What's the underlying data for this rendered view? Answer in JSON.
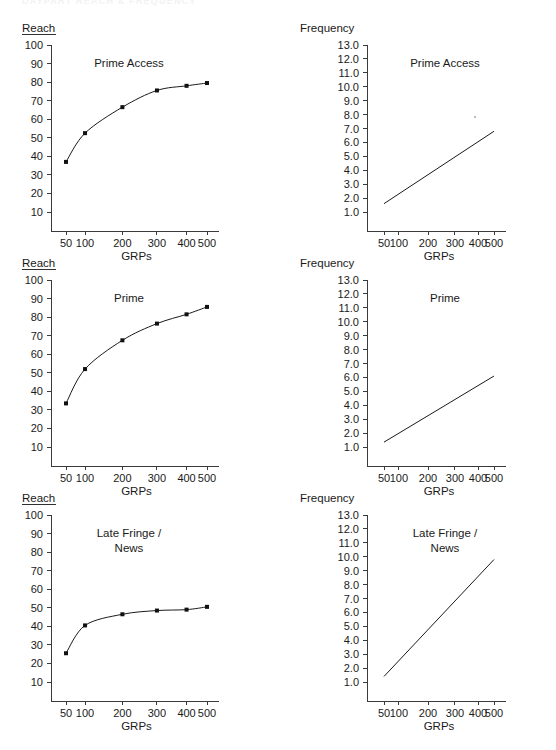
{
  "page": {
    "cut_off_header": "DAYPART REACH & FREQUENCY",
    "background_color": "#ffffff",
    "ink_color": "#1a1a1a"
  },
  "labels": {
    "reach_axis": "Reach",
    "frequency_axis": "Frequency",
    "grps_axis": "GRPs"
  },
  "x_ticks": [
    "50",
    "100",
    "200",
    "300",
    "400",
    "500"
  ],
  "reach_y_ticks": [
    "100",
    "90",
    "80",
    "70",
    "60",
    "50",
    "40",
    "30",
    "20",
    "10"
  ],
  "frequency_y_ticks": [
    "13.0",
    "12.0",
    "11.0",
    "10.0",
    "9.0",
    "8.0",
    "7.0",
    "6.0",
    "5.0",
    "4.0",
    "3.0",
    "2.0",
    "1.0"
  ],
  "series_names": {
    "prime_access": "Prime Access",
    "prime": "Prime",
    "late_fringe_line1": "Late Fringe /",
    "late_fringe_line2": "News"
  },
  "chart_data": [
    {
      "id": "reach-prime-access",
      "type": "line",
      "title": "Prime Access",
      "xlabel": "GRPs",
      "ylabel": "Reach",
      "x": [
        50,
        100,
        200,
        300,
        400,
        500
      ],
      "values": [
        37,
        52.5,
        66.5,
        75.5,
        78,
        79.5
      ],
      "xticks": [
        50,
        100,
        200,
        300,
        400,
        500
      ],
      "yticks": [
        10,
        20,
        30,
        40,
        50,
        60,
        70,
        80,
        90,
        100
      ],
      "ylim": [
        0,
        100
      ],
      "grid": false,
      "markers": "square",
      "legend": "none"
    },
    {
      "id": "frequency-prime-access",
      "type": "line",
      "title": "Prime Access",
      "xlabel": "GRPs",
      "ylabel": "Frequency",
      "x": [
        50,
        500
      ],
      "values": [
        1.6,
        6.8
      ],
      "xticks": [
        50,
        100,
        200,
        300,
        400,
        500
      ],
      "yticks": [
        1.0,
        2.0,
        3.0,
        4.0,
        5.0,
        6.0,
        7.0,
        8.0,
        9.0,
        10.0,
        11.0,
        12.0,
        13.0
      ],
      "ylim": [
        0,
        13.0
      ],
      "grid": false,
      "markers": "none",
      "legend": "none"
    },
    {
      "id": "reach-prime",
      "type": "line",
      "title": "Prime",
      "xlabel": "GRPs",
      "ylabel": "Reach",
      "x": [
        50,
        100,
        200,
        300,
        400,
        500
      ],
      "values": [
        33.5,
        52,
        67.5,
        76.5,
        81.5,
        85.5
      ],
      "xticks": [
        50,
        100,
        200,
        300,
        400,
        500
      ],
      "yticks": [
        10,
        20,
        30,
        40,
        50,
        60,
        70,
        80,
        90,
        100
      ],
      "ylim": [
        0,
        100
      ],
      "grid": false,
      "markers": "square",
      "legend": "none"
    },
    {
      "id": "frequency-prime",
      "type": "line",
      "title": "Prime",
      "xlabel": "GRPs",
      "ylabel": "Frequency",
      "x": [
        50,
        500
      ],
      "values": [
        1.35,
        6.1
      ],
      "xticks": [
        50,
        100,
        200,
        300,
        400,
        500
      ],
      "yticks": [
        1.0,
        2.0,
        3.0,
        4.0,
        5.0,
        6.0,
        7.0,
        8.0,
        9.0,
        10.0,
        11.0,
        12.0,
        13.0
      ],
      "ylim": [
        0,
        13.0
      ],
      "grid": false,
      "markers": "none",
      "legend": "none"
    },
    {
      "id": "reach-late-fringe-news",
      "type": "line",
      "title": "Late Fringe / News",
      "xlabel": "GRPs",
      "ylabel": "Reach",
      "x": [
        50,
        100,
        200,
        300,
        400,
        500
      ],
      "values": [
        25.5,
        40.5,
        46.5,
        48.5,
        49,
        50.5
      ],
      "xticks": [
        50,
        100,
        200,
        300,
        400,
        500
      ],
      "yticks": [
        10,
        20,
        30,
        40,
        50,
        60,
        70,
        80,
        90,
        100
      ],
      "ylim": [
        0,
        100
      ],
      "grid": false,
      "markers": "square",
      "legend": "none"
    },
    {
      "id": "frequency-late-fringe-news",
      "type": "line",
      "title": "Late Fringe / News",
      "xlabel": "GRPs",
      "ylabel": "Frequency",
      "x": [
        50,
        500
      ],
      "values": [
        1.4,
        9.8
      ],
      "xticks": [
        50,
        100,
        200,
        300,
        400,
        500
      ],
      "yticks": [
        1.0,
        2.0,
        3.0,
        4.0,
        5.0,
        6.0,
        7.0,
        8.0,
        9.0,
        10.0,
        11.0,
        12.0,
        13.0
      ],
      "ylim": [
        0,
        13.0
      ],
      "grid": false,
      "markers": "none",
      "legend": "none"
    }
  ]
}
